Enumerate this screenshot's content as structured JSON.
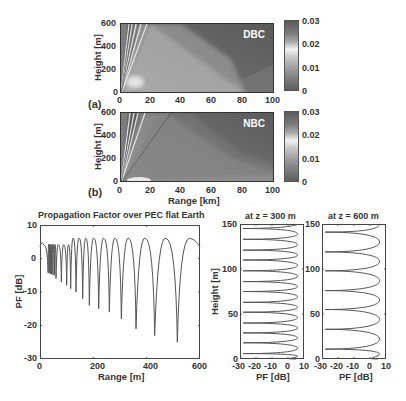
{
  "chart_data": [
    {
      "id": "a",
      "type": "heatmap",
      "panel_label": "(a)",
      "annotation": "DBC",
      "xlabel": "",
      "ylabel": "Height [m]",
      "xlim": [
        0,
        100
      ],
      "ylim": [
        0,
        600
      ],
      "xticks": [
        "0",
        "20",
        "40",
        "60",
        "80",
        "100"
      ],
      "yticks": [
        "0",
        "200",
        "400",
        "600"
      ],
      "colorbar": {
        "min": 0,
        "max": 0.03,
        "ticks": [
          "0.03",
          "0.02",
          "0.01",
          "0"
        ]
      }
    },
    {
      "id": "b",
      "type": "heatmap",
      "panel_label": "(b)",
      "annotation": "NBC",
      "xlabel": "Range [km]",
      "ylabel": "Height [m]",
      "xlim": [
        0,
        100
      ],
      "ylim": [
        0,
        600
      ],
      "xticks": [
        "0",
        "20",
        "40",
        "60",
        "80",
        "100"
      ],
      "yticks": [
        "0",
        "200",
        "400",
        "600"
      ],
      "colorbar": {
        "min": 0,
        "max": 0.03,
        "ticks": [
          "0.03",
          "0.02",
          "0.01",
          "0"
        ]
      }
    },
    {
      "id": "pf_range",
      "type": "line",
      "title": "Propagation Factor over PEC flat Earth",
      "xlabel": "Range [m]",
      "ylabel": "PF [dB]",
      "xlim": [
        0,
        600
      ],
      "ylim": [
        -30,
        10
      ],
      "xticks": [
        "0",
        "200",
        "400",
        "600"
      ],
      "yticks": [
        "10",
        "0",
        "-10",
        "-20",
        "-30"
      ],
      "peak_level_db": 6,
      "start_level_db": 3.5,
      "nulls": [
        {
          "x": 60,
          "y": -6
        },
        {
          "x": 80,
          "y": -7
        },
        {
          "x": 100,
          "y": -8
        },
        {
          "x": 115,
          "y": -9
        },
        {
          "x": 135,
          "y": -10
        },
        {
          "x": 160,
          "y": -12
        },
        {
          "x": 185,
          "y": -14
        },
        {
          "x": 220,
          "y": -15
        },
        {
          "x": 260,
          "y": -16
        },
        {
          "x": 305,
          "y": -18
        },
        {
          "x": 360,
          "y": -21
        },
        {
          "x": 430,
          "y": -23
        },
        {
          "x": 515,
          "y": -25
        }
      ]
    },
    {
      "id": "pf_height_300",
      "type": "line",
      "title": "at z = 300 m",
      "xlabel": "PF [dB]",
      "ylabel": "Height [m]",
      "xlim": [
        -30,
        10
      ],
      "ylim": [
        0,
        150
      ],
      "xticks": [
        "-30",
        "-20",
        "-10",
        "0",
        "10"
      ],
      "yticks": [
        "150",
        "100",
        "50",
        "0"
      ],
      "peak_level_db": 6,
      "nulls_height_m": [
        6,
        18,
        29,
        40,
        52,
        63,
        75,
        86,
        98,
        110,
        121,
        133,
        145
      ]
    },
    {
      "id": "pf_height_600",
      "type": "line",
      "title": "at z = 600 m",
      "xlabel": "PF [dB]",
      "ylabel": "",
      "xlim": [
        -30,
        10
      ],
      "ylim": [
        0,
        150
      ],
      "xticks": [
        "-30",
        "-20",
        "-10",
        "0",
        "10"
      ],
      "yticks": [
        "150",
        "100",
        "50",
        "0"
      ],
      "peak_level_db": 6,
      "nulls_height_m": [
        11,
        33,
        55,
        76,
        98,
        119,
        141
      ]
    }
  ]
}
